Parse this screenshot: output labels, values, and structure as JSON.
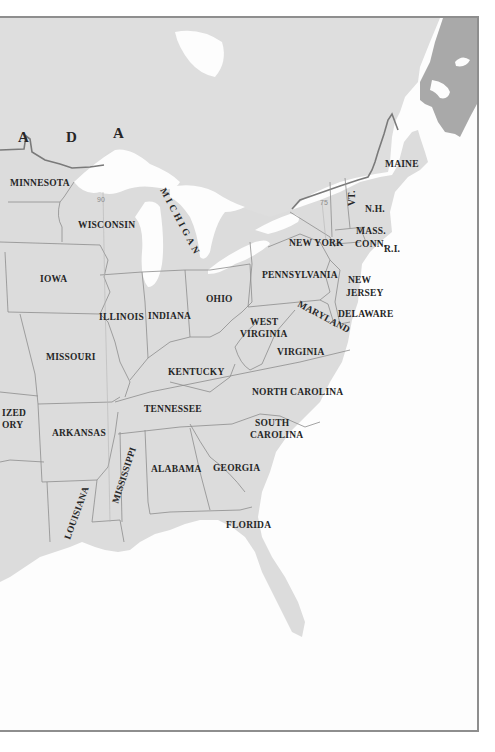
{
  "map": {
    "title": "",
    "colors": {
      "land_us": "#dcdcdc",
      "land_canada": "#dedede",
      "maritime_provinces": "#a9a9a9",
      "water": "#fdfdfd",
      "state_border": "#8d8d8d",
      "international_border": "#7a7a7a",
      "label_text": "#262626",
      "frame": "#8e8e8e"
    },
    "country_label_letters": [
      "A",
      "D",
      "A"
    ],
    "meridians": [
      "90",
      "75"
    ],
    "states": [
      {
        "id": "minnesota",
        "label": "MINNESOTA"
      },
      {
        "id": "wisconsin",
        "label": "WISCONSIN"
      },
      {
        "id": "michigan",
        "label": "MICHIGAN"
      },
      {
        "id": "iowa",
        "label": "IOWA"
      },
      {
        "id": "illinois",
        "label": "ILLINOIS"
      },
      {
        "id": "indiana",
        "label": "INDIANA"
      },
      {
        "id": "ohio",
        "label": "OHIO"
      },
      {
        "id": "missouri",
        "label": "MISSOURI"
      },
      {
        "id": "kentucky",
        "label": "KENTUCKY"
      },
      {
        "id": "west-virginia",
        "label_line1": "WEST",
        "label_line2": "VIRGINIA"
      },
      {
        "id": "virginia",
        "label": "VIRGINIA"
      },
      {
        "id": "maryland",
        "label": "MARYLAND"
      },
      {
        "id": "delaware",
        "label": "DELAWARE"
      },
      {
        "id": "new-jersey",
        "label_line1": "NEW",
        "label_line2": "JERSEY"
      },
      {
        "id": "pennsylvania",
        "label": "PENNSYLVANIA"
      },
      {
        "id": "new-york",
        "label": "NEW YORK"
      },
      {
        "id": "vermont",
        "label": "VT."
      },
      {
        "id": "new-hampshire",
        "label": "N.H."
      },
      {
        "id": "maine",
        "label": "MAINE"
      },
      {
        "id": "massachusetts",
        "label": "MASS."
      },
      {
        "id": "connecticut",
        "label": "CONN."
      },
      {
        "id": "rhode-island",
        "label": "R.I."
      },
      {
        "id": "arkansas",
        "label": "ARKANSAS"
      },
      {
        "id": "tennessee",
        "label": "TENNESSEE"
      },
      {
        "id": "north-carolina",
        "label": "NORTH CAROLINA"
      },
      {
        "id": "south-carolina",
        "label_line1": "SOUTH",
        "label_line2": "CAROLINA"
      },
      {
        "id": "mississippi",
        "label": "MISSISSIPPI"
      },
      {
        "id": "alabama",
        "label": "ALABAMA"
      },
      {
        "id": "georgia",
        "label": "GEORGIA"
      },
      {
        "id": "louisiana",
        "label": "LOUISIANA"
      },
      {
        "id": "florida",
        "label": "FLORIDA"
      },
      {
        "id": "unorganized-territory",
        "label_line1": "IZED",
        "label_line2": "ORY"
      }
    ]
  }
}
